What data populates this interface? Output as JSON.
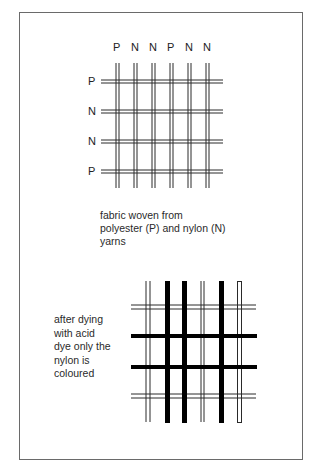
{
  "figure": {
    "top_diagram": {
      "column_labels": [
        "P",
        "N",
        "N",
        "P",
        "N",
        "N"
      ],
      "row_labels": [
        "P",
        "N",
        "N",
        "P"
      ],
      "caption": [
        "fabric woven from",
        "polyester (P) and nylon (N)",
        "yarns"
      ]
    },
    "bottom_diagram": {
      "caption": [
        "after dying",
        "with acid",
        "dye only the",
        "nylon is",
        "coloured"
      ],
      "column_states": [
        "polyester-undyed",
        "nylon-dyed",
        "nylon-dyed",
        "polyester-undyed",
        "nylon-dyed",
        "hollow"
      ],
      "row_states": [
        "polyester-undyed",
        "nylon-dyed",
        "nylon-dyed",
        "polyester-undyed"
      ]
    },
    "colors": {
      "line": "#2a2a2a",
      "dyed": "#000000",
      "frame": "#6a6a6a",
      "background": "#ffffff"
    }
  }
}
